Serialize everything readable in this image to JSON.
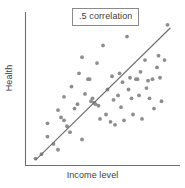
{
  "chart_data": {
    "type": "scatter",
    "title": "",
    "annotation": ".5 correlation",
    "xlabel": "Income level",
    "ylabel": "Health",
    "grid": false,
    "legend": false,
    "xlim": [
      0,
      100
    ],
    "ylim": [
      0,
      100
    ],
    "xticks": [],
    "yticks": [],
    "correlation": 0.5,
    "trend_line": {
      "x": [
        5,
        95
      ],
      "y": [
        2,
        92
      ]
    },
    "points": [
      {
        "x": 5,
        "y": 3
      },
      {
        "x": 9,
        "y": 6
      },
      {
        "x": 13,
        "y": 18
      },
      {
        "x": 13,
        "y": 27
      },
      {
        "x": 17,
        "y": 13
      },
      {
        "x": 20,
        "y": 9
      },
      {
        "x": 20,
        "y": 36
      },
      {
        "x": 22,
        "y": 31
      },
      {
        "x": 24,
        "y": 29
      },
      {
        "x": 24,
        "y": 45
      },
      {
        "x": 26,
        "y": 25
      },
      {
        "x": 28,
        "y": 21
      },
      {
        "x": 29,
        "y": 52
      },
      {
        "x": 31,
        "y": 37
      },
      {
        "x": 33,
        "y": 40
      },
      {
        "x": 34,
        "y": 61
      },
      {
        "x": 36,
        "y": 72
      },
      {
        "x": 36,
        "y": 16
      },
      {
        "x": 38,
        "y": 47
      },
      {
        "x": 40,
        "y": 57
      },
      {
        "x": 41,
        "y": 57
      },
      {
        "x": 42,
        "y": 42
      },
      {
        "x": 43,
        "y": 44
      },
      {
        "x": 44,
        "y": 41
      },
      {
        "x": 45,
        "y": 40
      },
      {
        "x": 46,
        "y": 68
      },
      {
        "x": 47,
        "y": 39
      },
      {
        "x": 48,
        "y": 30
      },
      {
        "x": 50,
        "y": 80
      },
      {
        "x": 52,
        "y": 33
      },
      {
        "x": 53,
        "y": 50
      },
      {
        "x": 55,
        "y": 28
      },
      {
        "x": 56,
        "y": 59
      },
      {
        "x": 57,
        "y": 43
      },
      {
        "x": 58,
        "y": 26
      },
      {
        "x": 60,
        "y": 46
      },
      {
        "x": 61,
        "y": 61
      },
      {
        "x": 62,
        "y": 38
      },
      {
        "x": 63,
        "y": 55
      },
      {
        "x": 64,
        "y": 29
      },
      {
        "x": 66,
        "y": 86
      },
      {
        "x": 67,
        "y": 50
      },
      {
        "x": 68,
        "y": 58
      },
      {
        "x": 69,
        "y": 44
      },
      {
        "x": 70,
        "y": 33
      },
      {
        "x": 72,
        "y": 57
      },
      {
        "x": 73,
        "y": 57
      },
      {
        "x": 74,
        "y": 46
      },
      {
        "x": 75,
        "y": 62
      },
      {
        "x": 76,
        "y": 30
      },
      {
        "x": 78,
        "y": 70
      },
      {
        "x": 79,
        "y": 51
      },
      {
        "x": 80,
        "y": 56
      },
      {
        "x": 81,
        "y": 44
      },
      {
        "x": 83,
        "y": 57
      },
      {
        "x": 84,
        "y": 37
      },
      {
        "x": 86,
        "y": 65
      },
      {
        "x": 87,
        "y": 73
      },
      {
        "x": 88,
        "y": 58
      },
      {
        "x": 89,
        "y": 42
      },
      {
        "x": 91,
        "y": 70
      },
      {
        "x": 93,
        "y": 94
      }
    ]
  },
  "colors": {
    "dot": "#8d8d8d",
    "axis": "#6f6f6f",
    "trend": "#6b6b6b",
    "text": "#3d3d3d",
    "background": "#ffffff"
  }
}
